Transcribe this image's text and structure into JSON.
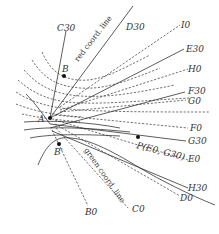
{
  "figure": {
    "type": "coordinate-grid-diagram",
    "points": {
      "A": {
        "label": "A"
      },
      "B": {
        "label": "B"
      },
      "B_prime": {
        "label": "B'"
      },
      "P": {
        "label": "P(E0, G30)"
      }
    },
    "annotations": {
      "red_line": "red coord. line",
      "green_line": "green coord. line"
    },
    "line_labels": {
      "C30": "C30",
      "D30": "D30",
      "I0": "I0",
      "E30": "E30",
      "H0": "H0",
      "F30": "F30",
      "G0": "G0",
      "F0": "F0",
      "G30": "G30",
      "E0": "E0",
      "H30": "H30",
      "D0": "D0",
      "C0": "C0",
      "B0": "B0"
    }
  }
}
